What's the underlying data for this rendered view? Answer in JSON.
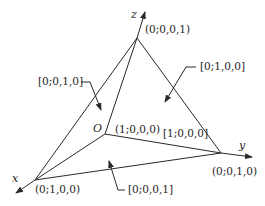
{
  "diagram": {
    "type": "tetrahedron-coordinate-diagram",
    "colors": {
      "stroke": "#2a2a2a",
      "text": "#1e1e1e",
      "background": "#ffffff"
    },
    "axes": {
      "x": "x",
      "y": "y",
      "z": "z"
    },
    "origin": {
      "label": "O",
      "coord": "(1;0,0,0)"
    },
    "vertices": {
      "z_vertex": "(0;0,0,1)",
      "x_vertex": "(0;1,0,0)",
      "y_vertex": "(0;0,1,0)"
    },
    "planes": {
      "xz_plane": "[0;0,1,0]",
      "yz_plane": "[0;1,0,0]",
      "xy_plane": "[0;0,0,1]",
      "far_plane": "[1;0,0,0]"
    }
  }
}
